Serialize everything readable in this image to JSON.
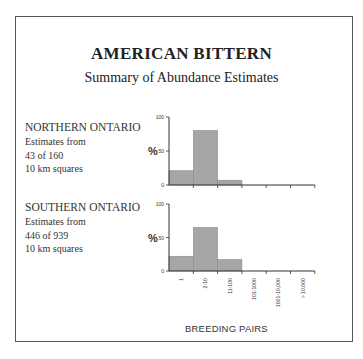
{
  "title": "AMERICAN BITTERN",
  "subtitle": "Summary of Abundance Estimates",
  "regions": [
    {
      "name": "NORTHERN ONTARIO",
      "line1": "Estimates from",
      "line2": "43 of 160",
      "line3": "10 km squares"
    },
    {
      "name": "SOUTHERN ONTARIO",
      "line1": "Estimates from",
      "line2": "446 of 939",
      "line3": "10 km squares"
    }
  ],
  "axis": {
    "ylabel": "%",
    "yticks": [
      "100",
      "50",
      "0"
    ],
    "xlabel": "BREEDING PAIRS",
    "xticks": [
      "1",
      "2-10",
      "11-100",
      "101-1000",
      "1001-10,000",
      "> 10,000"
    ]
  },
  "colors": {
    "bar": "#a6a6a6",
    "axis": "#333333",
    "frame": "#555555"
  },
  "chart_data": [
    {
      "type": "bar",
      "title": "NORTHERN ONTARIO",
      "categories": [
        "1",
        "2-10",
        "11-100",
        "101-1000",
        "1001-10,000",
        "> 10,000"
      ],
      "values": [
        21,
        80,
        7,
        0,
        0,
        0
      ],
      "xlabel": "BREEDING PAIRS",
      "ylabel": "%",
      "ylim": [
        0,
        100
      ],
      "grid": false
    },
    {
      "type": "bar",
      "title": "SOUTHERN ONTARIO",
      "categories": [
        "1",
        "2-10",
        "11-100",
        "101-1000",
        "1001-10,000",
        "> 10,000"
      ],
      "values": [
        22,
        65,
        17,
        0,
        0,
        0
      ],
      "xlabel": "BREEDING PAIRS",
      "ylabel": "%",
      "ylim": [
        0,
        100
      ],
      "grid": false
    }
  ]
}
